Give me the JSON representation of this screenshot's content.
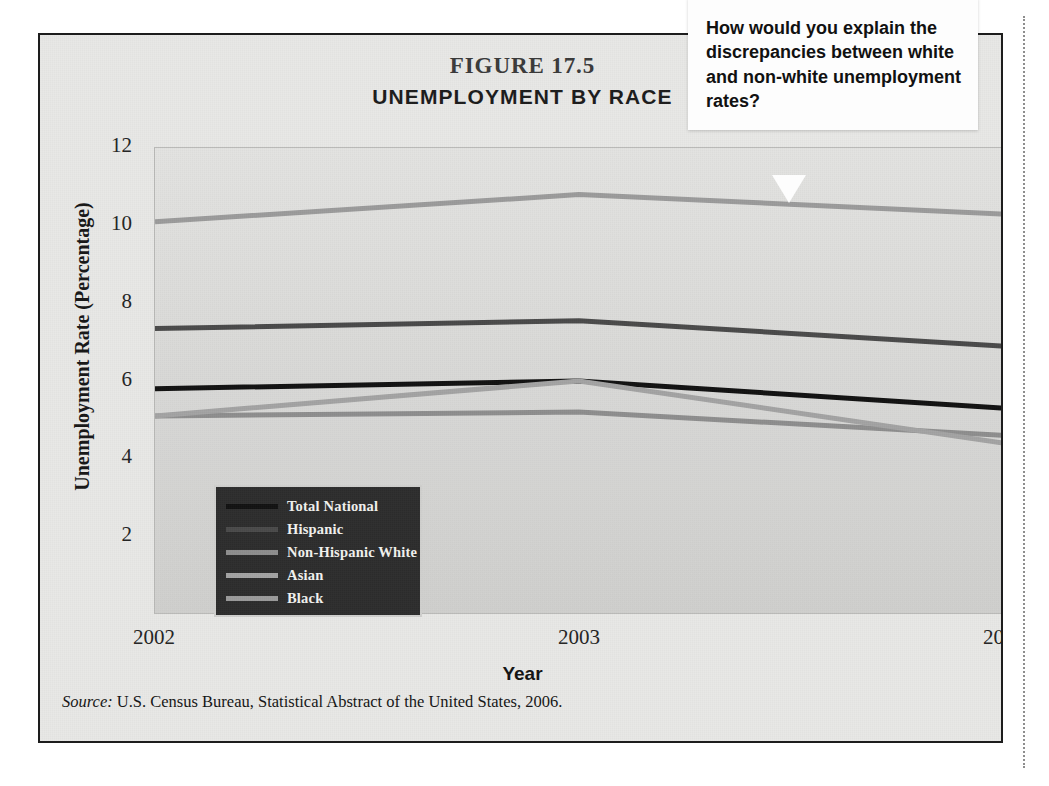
{
  "figure": {
    "number": "FIGURE 17.5",
    "title": "UNEMPLOYMENT BY RACE",
    "source_prefix": "Source:",
    "source_text": "U.S. Census Bureau, Statistical Abstract of the United States, 2006."
  },
  "callout": {
    "text": "How would you explain the discrepancies between white and non-white unemployment rates?"
  },
  "chart_data": {
    "type": "line",
    "title": "UNEMPLOYMENT BY RACE",
    "subtitle": "FIGURE 17.5",
    "xlabel": "Year",
    "ylabel": "Unemployment Rate (Percentage)",
    "categories": [
      "2002",
      "2003",
      "2004"
    ],
    "x_tick_labels": [
      "2002",
      "2003",
      "2004"
    ],
    "y_tick_labels": [
      "12",
      "10",
      "8",
      "6",
      "4",
      "2"
    ],
    "y_ticks": [
      12,
      10,
      8,
      6,
      4,
      2
    ],
    "ylim": [
      0,
      12
    ],
    "grid": false,
    "legend_position": "inside-lower-left",
    "series": [
      {
        "name": "Total National",
        "values": [
          5.8,
          6.0,
          5.3
        ],
        "color": "#111111"
      },
      {
        "name": "Hispanic",
        "values": [
          7.35,
          7.55,
          6.9
        ],
        "color": "#4a4a4a"
      },
      {
        "name": "Non-Hispanic White",
        "values": [
          5.1,
          5.2,
          4.6
        ],
        "color": "#8e8e8e"
      },
      {
        "name": "Asian",
        "values": [
          5.1,
          6.0,
          4.4
        ],
        "color": "#a3a3a3"
      },
      {
        "name": "Black",
        "values": [
          10.1,
          10.8,
          10.3
        ],
        "color": "#9b9b9b"
      }
    ]
  }
}
